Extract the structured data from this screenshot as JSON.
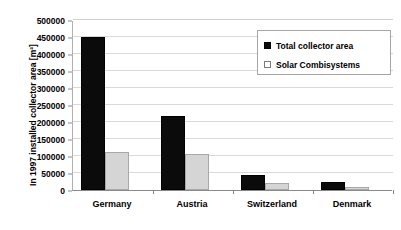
{
  "chart_data": {
    "type": "bar",
    "title": "",
    "subtitle": "",
    "xlabel": "",
    "ylabel": "In 1997 installed collector area [m²]",
    "categories": [
      "Germany",
      "Austria",
      "Switzerland",
      "Denmark"
    ],
    "series": [
      {
        "name": "Total collector area",
        "color": "#0b0b0b",
        "values": [
          450000,
          217000,
          43000,
          24000
        ]
      },
      {
        "name": "Solar Combisystems",
        "color": "#d5d5d5",
        "values": [
          112000,
          106000,
          21000,
          8000
        ]
      }
    ],
    "ylim": [
      0,
      500000
    ],
    "ytick_values": [
      0,
      50000,
      100000,
      150000,
      200000,
      250000,
      300000,
      350000,
      400000,
      450000,
      500000
    ],
    "ytick_labels": [
      "0",
      "50000",
      "100000",
      "150000",
      "200000",
      "250000",
      "300000",
      "350000",
      "400000",
      "450000",
      "500000"
    ],
    "grid": true,
    "grid_axis": "y",
    "legend_position": "top-right",
    "legend_entries": [
      "Total collector area",
      "Solar Combisystems"
    ]
  },
  "colors": {
    "total_collector_area": "#0b0b0b",
    "solar_combisystems": "#d5d5d5",
    "gridline": "#d9d9d9",
    "axis": "#8a8a8a",
    "background": "#ffffff",
    "text": "#000000"
  }
}
